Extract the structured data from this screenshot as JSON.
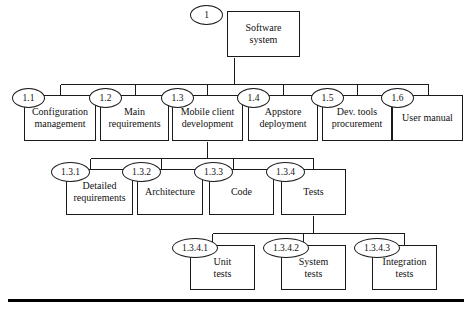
{
  "diagram": {
    "type": "work-breakdown-structure",
    "font_style": "serif",
    "line_color": "#1a1a1a",
    "background": "#ffffff"
  },
  "nodes": {
    "root": {
      "id": "1",
      "label": "Software\nsystem",
      "box": {
        "x": 227,
        "y": 11,
        "w": 73,
        "h": 46
      },
      "ellipse": {
        "x": 190,
        "y": 5,
        "w": 33,
        "h": 20
      },
      "id_font": 9.5,
      "label_font": 10
    },
    "level2": [
      {
        "id": "1.1",
        "label": "Configuration\nmanagement",
        "box": {
          "x": 24,
          "y": 95,
          "w": 72,
          "h": 46
        },
        "ellipse": {
          "x": 12,
          "y": 88,
          "w": 33,
          "h": 20
        },
        "id_font": 9.5,
        "label_font": 10
      },
      {
        "id": "1.2",
        "label": "Main\nrequirements",
        "box": {
          "x": 100,
          "y": 95,
          "w": 69,
          "h": 46
        },
        "ellipse": {
          "x": 89,
          "y": 88,
          "w": 33,
          "h": 20
        },
        "id_font": 9.5,
        "label_font": 10
      },
      {
        "id": "1.3",
        "label": "Mobile client\ndevelopment",
        "box": {
          "x": 172,
          "y": 95,
          "w": 71,
          "h": 46
        },
        "ellipse": {
          "x": 161,
          "y": 88,
          "w": 33,
          "h": 20
        },
        "id_font": 9.5,
        "label_font": 10
      },
      {
        "id": "1.4",
        "label": "Appstore\ndeployment",
        "box": {
          "x": 248,
          "y": 95,
          "w": 70,
          "h": 46
        },
        "ellipse": {
          "x": 237,
          "y": 88,
          "w": 33,
          "h": 20
        },
        "id_font": 9.5,
        "label_font": 10
      },
      {
        "id": "1.5",
        "label": "Dev. tools\nprocurement",
        "box": {
          "x": 322,
          "y": 95,
          "w": 70,
          "h": 46
        },
        "ellipse": {
          "x": 311,
          "y": 88,
          "w": 33,
          "h": 20
        },
        "id_font": 9.5,
        "label_font": 10
      },
      {
        "id": "1.6",
        "label": "User manual",
        "box": {
          "x": 392,
          "y": 95,
          "w": 71,
          "h": 46
        },
        "ellipse": {
          "x": 381,
          "y": 88,
          "w": 33,
          "h": 20
        },
        "id_font": 9.5,
        "label_font": 10
      }
    ],
    "level3": [
      {
        "id": "1.3.1",
        "label": "Detailed\nrequirements",
        "box": {
          "x": 66,
          "y": 169,
          "w": 67,
          "h": 46
        },
        "ellipse": {
          "x": 51,
          "y": 162,
          "w": 39,
          "h": 20
        },
        "id_font": 9.5,
        "label_font": 10
      },
      {
        "id": "1.3.2",
        "label": "Architecture",
        "box": {
          "x": 137,
          "y": 169,
          "w": 66,
          "h": 46
        },
        "ellipse": {
          "x": 122,
          "y": 162,
          "w": 39,
          "h": 20
        },
        "id_font": 9.5,
        "label_font": 10
      },
      {
        "id": "1.3.3",
        "label": "Code",
        "box": {
          "x": 209,
          "y": 169,
          "w": 65,
          "h": 46
        },
        "ellipse": {
          "x": 194,
          "y": 162,
          "w": 39,
          "h": 20
        },
        "id_font": 9.5,
        "label_font": 10
      },
      {
        "id": "1.3.4",
        "label": "Tests",
        "box": {
          "x": 281,
          "y": 169,
          "w": 65,
          "h": 46
        },
        "ellipse": {
          "x": 266,
          "y": 162,
          "w": 39,
          "h": 20
        },
        "id_font": 9.5,
        "label_font": 10
      }
    ],
    "level4": [
      {
        "id": "1.3.4.1",
        "label": "Unit\ntests",
        "box": {
          "x": 190,
          "y": 245,
          "w": 65,
          "h": 45
        },
        "ellipse": {
          "x": 172,
          "y": 238,
          "w": 46,
          "h": 20
        },
        "id_font": 9.5,
        "label_font": 10
      },
      {
        "id": "1.3.4.2",
        "label": "System\ntests",
        "box": {
          "x": 281,
          "y": 245,
          "w": 65,
          "h": 45
        },
        "ellipse": {
          "x": 263,
          "y": 238,
          "w": 46,
          "h": 20
        },
        "id_font": 9.5,
        "label_font": 10
      },
      {
        "id": "1.3.4.3",
        "label": "Integration\ntests",
        "box": {
          "x": 372,
          "y": 245,
          "w": 65,
          "h": 45
        },
        "ellipse": {
          "x": 354,
          "y": 238,
          "w": 46,
          "h": 20
        },
        "id_font": 9.5,
        "label_font": 10
      }
    ]
  },
  "connectors": {
    "level2_bus": {
      "y": 84,
      "x1": 60,
      "x2": 428
    },
    "level2_root_drop": {
      "x": 234,
      "y1": 57,
      "y2": 84
    },
    "level2_drops_x": [
      60,
      135,
      207,
      283,
      357,
      428
    ],
    "level3_bus": {
      "y": 158,
      "x1": 90,
      "x2": 313
    },
    "level3_parent_drop": {
      "x": 207,
      "y1": 141,
      "y2": 158
    },
    "level3_drops_x": [
      90,
      161,
      233,
      313
    ],
    "level4_bus": {
      "y": 233,
      "x1": 212,
      "x2": 404
    },
    "level4_parent_drop": {
      "x": 313,
      "y1": 215,
      "y2": 233
    },
    "level4_drops_x": [
      212,
      303,
      404
    ]
  },
  "bottom_rule": {
    "x": 8,
    "y": 299,
    "w": 456,
    "h": 3,
    "color": "#000000"
  }
}
